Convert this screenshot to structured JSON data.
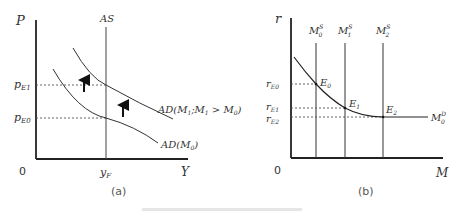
{
  "figure": {
    "panel_a": {
      "caption": "(a)",
      "axes": {
        "y_label": "P",
        "x_label": "Y",
        "origin": "0"
      },
      "curves": {
        "as_label": "AS",
        "ad0_prefix": "AD(M",
        "ad0_sub": "0",
        "ad0_suffix": ")",
        "ad1_prefix": "AD(M",
        "ad1_sub": "1",
        "ad1_mid": ";M",
        "ad1_sub2": "1",
        "ad1_suffix": " > M",
        "ad1_sub3": "0",
        "ad1_close": ")"
      },
      "ticks": {
        "pE1_main": "p",
        "pE1_sub": "E1",
        "pE0_main": "p",
        "pE0_sub": "E0",
        "yF_main": "y",
        "yF_sub": "F"
      },
      "arrows": [
        "shift-up-arrow",
        "shift-up-arrow"
      ]
    },
    "panel_b": {
      "caption": "(b)",
      "axes": {
        "y_label": "r",
        "x_label": "M",
        "origin": "0"
      },
      "supply_lines": [
        {
          "main": "M",
          "sub": "0",
          "sup": "S"
        },
        {
          "main": "M",
          "sub": "1",
          "sup": "S"
        },
        {
          "main": "M",
          "sub": "2",
          "sup": "S"
        }
      ],
      "demand": {
        "main": "M",
        "sub": "0",
        "sup": "D"
      },
      "equilibria": [
        {
          "main": "E",
          "sub": "0"
        },
        {
          "main": "E",
          "sub": "1"
        },
        {
          "main": "E",
          "sub": "2"
        }
      ],
      "ticks": [
        {
          "main": "r",
          "sub": "E0"
        },
        {
          "main": "r",
          "sub": "E1"
        },
        {
          "main": "r",
          "sub": "E2"
        }
      ]
    },
    "colors": {
      "line": "#222222",
      "thin_line": "#444444",
      "dashed": "#555555"
    }
  }
}
